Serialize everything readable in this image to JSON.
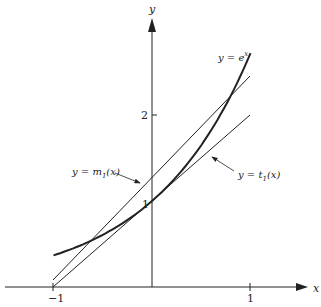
{
  "chart_data": {
    "type": "line",
    "title": "",
    "xlabel": "x",
    "ylabel": "y",
    "xlim": [
      -1.55,
      1.65
    ],
    "ylim": [
      0,
      3.3
    ],
    "x_ticks": [
      {
        "value": -1,
        "label": "-1"
      },
      {
        "value": 1,
        "label": "1"
      }
    ],
    "y_ticks": [
      {
        "value": 1,
        "label": "1"
      },
      {
        "value": 2,
        "label": "2"
      }
    ],
    "grid": false,
    "series": [
      {
        "name": "y = e^x",
        "label": "y = e",
        "sup": "x",
        "function": "exp(x)",
        "x_range": [
          -1,
          1
        ],
        "stroke_width": 2
      },
      {
        "name": "y = m1(x)",
        "label_pre": "y = m",
        "label_sub": "1",
        "label_post": "(x)",
        "function": "1.18 + 1.14*x",
        "x_range": [
          -1,
          1
        ],
        "stroke_width": 1
      },
      {
        "name": "y = t1(x)",
        "label_pre": "y = t",
        "label_sub": "1",
        "label_post": "(x)",
        "function": "1 + x",
        "x_range": [
          -1,
          1
        ],
        "stroke_width": 1
      }
    ],
    "annotations": [
      {
        "text": "y = m1(x)",
        "arrow_to": [
          -0.15,
          1.0
        ]
      },
      {
        "text": "y = t1(x)",
        "arrow_to": [
          0.55,
          1.55
        ]
      }
    ]
  },
  "labels": {
    "x_axis": "x",
    "y_axis": "y",
    "tick_neg1": "−1",
    "tick_pos1": "1",
    "tick_y1": "1",
    "tick_y2": "2",
    "exp_label": "y = e",
    "exp_sup": "x",
    "m1_pre": "y = m",
    "m1_sub": "1",
    "m1_post": "(x)",
    "t1_pre": "y = t",
    "t1_sub": "1",
    "t1_post": "(x)"
  },
  "colors": {
    "ink": "#222222",
    "background": "#ffffff"
  }
}
